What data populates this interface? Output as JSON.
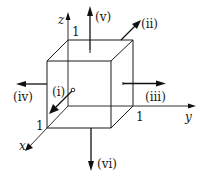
{
  "diagram": {
    "type": "unit-cube-face-normals",
    "axes": {
      "x": {
        "label": "x"
      },
      "y": {
        "label": "y"
      },
      "z": {
        "label": "z"
      }
    },
    "tick_labels": {
      "x_unit": "1",
      "y_unit": "1",
      "z_unit": "1"
    },
    "face_normals": [
      {
        "id": "i",
        "label": "(i)",
        "direction": "+x",
        "face": "front"
      },
      {
        "id": "ii",
        "label": "(ii)",
        "direction": "+x+y+z diagonal (top-right edge)",
        "face": "edge"
      },
      {
        "id": "iii",
        "label": "(iii)",
        "direction": "+y",
        "face": "right"
      },
      {
        "id": "iv",
        "label": "(iv)",
        "direction": "-y",
        "face": "left"
      },
      {
        "id": "v",
        "label": "(v)",
        "direction": "+z",
        "face": "top"
      },
      {
        "id": "vi",
        "label": "(vi)",
        "direction": "-z",
        "face": "bottom"
      }
    ],
    "colors": {
      "stroke": "#1a1a1a",
      "background": "#ffffff"
    }
  }
}
